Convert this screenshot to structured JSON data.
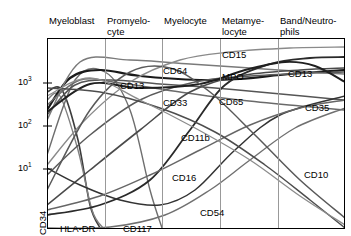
{
  "figure": {
    "kind": "antigen-expression-maturation-chart",
    "background": "#ffffff",
    "frame_color": "#000000",
    "divider_color": "#999999"
  },
  "stages": [
    {
      "id": "myeloblast",
      "label": "Myeloblast",
      "x": 47,
      "label_x": 49,
      "label_y": 16
    },
    {
      "id": "promyelocyte",
      "label": "Promyelo-\ncyte",
      "x": 105,
      "label_x": 107,
      "label_y": 16
    },
    {
      "id": "myelocyte",
      "label": "Myelocyte",
      "x": 162,
      "label_x": 164,
      "label_y": 16
    },
    {
      "id": "metamyelocyte",
      "label": "Metamye-\nlocyte",
      "x": 220,
      "label_x": 222,
      "label_y": 16
    },
    {
      "id": "band_neutrophil",
      "label": "Band/Neutro-\nphils",
      "x": 278,
      "label_x": 280,
      "label_y": 16
    }
  ],
  "yaxis": {
    "scale": "log",
    "ticks": [
      {
        "value": 1000,
        "mantissa": "10",
        "exponent": "3",
        "y": 83,
        "label_x": 18,
        "label_y": 77
      },
      {
        "value": 100,
        "mantissa": "10",
        "exponent": "2",
        "y": 126,
        "label_x": 18,
        "label_y": 120
      },
      {
        "value": 10,
        "mantissa": "10",
        "exponent": "1",
        "y": 169,
        "label_x": 18,
        "label_y": 163
      }
    ]
  },
  "markers": [
    {
      "name": "CD34",
      "x": 48,
      "y": 224,
      "rotated": true
    },
    {
      "name": "HLA-DR",
      "x": 60,
      "y": 223,
      "rotated": false
    },
    {
      "name": "CD117",
      "x": 123,
      "y": 223,
      "rotated": false
    },
    {
      "name": "CD13",
      "x": 120,
      "y": 80,
      "rotated": false
    },
    {
      "name": "CD64",
      "x": 163,
      "y": 65,
      "rotated": false
    },
    {
      "name": "CD33",
      "x": 163,
      "y": 97,
      "rotated": false
    },
    {
      "name": "CD11b",
      "x": 181,
      "y": 132,
      "rotated": false
    },
    {
      "name": "CD16",
      "x": 172,
      "y": 172,
      "rotated": false
    },
    {
      "name": "CD54",
      "x": 200,
      "y": 207,
      "rotated": false
    },
    {
      "name": "CD15",
      "x": 222,
      "y": 49,
      "rotated": false
    },
    {
      "name": "MPO",
      "x": 222,
      "y": 71,
      "rotated": false
    },
    {
      "name": "CD65",
      "x": 219,
      "y": 96,
      "rotated": false
    },
    {
      "name": "CD13",
      "x": 288,
      "y": 68,
      "rotated": false
    },
    {
      "name": "CD35",
      "x": 305,
      "y": 102,
      "rotated": false
    },
    {
      "name": "CD10",
      "x": 304,
      "y": 169,
      "rotated": false
    }
  ],
  "chart_data": {
    "type": "line",
    "title": "",
    "xlabel": "",
    "ylabel": "",
    "xscale": "maturation-stage",
    "yscale": "log",
    "ylim": [
      3,
      4000
    ],
    "grid": false,
    "legend": "inline-labels",
    "x": [
      "Myeloblast",
      "Promyelocyte",
      "Myelocyte",
      "Metamyelocyte",
      "Band/Neutrophils"
    ],
    "series": [
      {
        "name": "CD34",
        "color": "#3c3c3c",
        "width": 1.6,
        "values": [
          900,
          12,
          4,
          3,
          3
        ],
        "points": [
          [
            47,
            92
          ],
          [
            62,
            90
          ],
          [
            78,
            140
          ],
          [
            90,
            205
          ],
          [
            100,
            228
          ]
        ]
      },
      {
        "name": "HLA-DR",
        "color": "#808080",
        "width": 1.4,
        "values": [
          700,
          20,
          4,
          3,
          3
        ],
        "points": [
          [
            47,
            100
          ],
          [
            60,
            96
          ],
          [
            78,
            150
          ],
          [
            92,
            210
          ],
          [
            103,
            228
          ]
        ]
      },
      {
        "name": "CD117",
        "color": "#6e6e6e",
        "width": 1.4,
        "values": [
          60,
          600,
          250,
          12,
          4
        ],
        "points": [
          [
            47,
            155
          ],
          [
            75,
            80
          ],
          [
            105,
            72
          ],
          [
            130,
            110
          ],
          [
            150,
            190
          ],
          [
            162,
            228
          ]
        ]
      },
      {
        "name": "CD13",
        "color": "#1a1a1a",
        "width": 2.2,
        "values": [
          300,
          1000,
          900,
          800,
          1100
        ],
        "points": [
          [
            47,
            110
          ],
          [
            70,
            78
          ],
          [
            100,
            70
          ],
          [
            140,
            76
          ],
          [
            200,
            80
          ],
          [
            240,
            79
          ],
          [
            290,
            74
          ],
          [
            345,
            70
          ]
        ]
      },
      {
        "name": "CD64",
        "color": "#555555",
        "width": 1.5,
        "values": [
          250,
          800,
          700,
          600,
          450
        ],
        "points": [
          [
            47,
            115
          ],
          [
            75,
            85
          ],
          [
            110,
            80
          ],
          [
            160,
            84
          ],
          [
            215,
            88
          ],
          [
            270,
            93
          ],
          [
            345,
            100
          ]
        ]
      },
      {
        "name": "CD33",
        "color": "#6a6a6a",
        "width": 1.5,
        "values": [
          400,
          900,
          700,
          500,
          350
        ],
        "points": [
          [
            47,
            105
          ],
          [
            80,
            80
          ],
          [
            120,
            83
          ],
          [
            180,
            92
          ],
          [
            240,
            100
          ],
          [
            300,
            106
          ],
          [
            345,
            110
          ]
        ]
      },
      {
        "name": "MPO",
        "color": "#7a7a7a",
        "width": 1.5,
        "values": [
          200,
          1400,
          1200,
          1000,
          900
        ],
        "points": [
          [
            47,
            120
          ],
          [
            80,
            62
          ],
          [
            130,
            60
          ],
          [
            190,
            64
          ],
          [
            250,
            68
          ],
          [
            310,
            72
          ],
          [
            345,
            74
          ]
        ]
      },
      {
        "name": "CD15",
        "color": "#8a8a8a",
        "width": 1.4,
        "values": [
          20,
          200,
          900,
          1400,
          1500
        ],
        "points": [
          [
            47,
            165
          ],
          [
            85,
            120
          ],
          [
            130,
            82
          ],
          [
            180,
            60
          ],
          [
            230,
            52
          ],
          [
            290,
            48
          ],
          [
            345,
            47
          ]
        ]
      },
      {
        "name": "CD65",
        "color": "#5a5a5a",
        "width": 1.5,
        "values": [
          15,
          120,
          500,
          900,
          1000
        ],
        "points": [
          [
            47,
            175
          ],
          [
            90,
            135
          ],
          [
            140,
            100
          ],
          [
            195,
            82
          ],
          [
            250,
            76
          ],
          [
            310,
            73
          ],
          [
            345,
            72
          ]
        ]
      },
      {
        "name": "CD11b",
        "color": "#4a4a4a",
        "width": 1.6,
        "values": [
          5,
          20,
          150,
          700,
          1000
        ],
        "points": [
          [
            47,
            205
          ],
          [
            90,
            170
          ],
          [
            140,
            130
          ],
          [
            190,
            92
          ],
          [
            240,
            76
          ],
          [
            300,
            70
          ],
          [
            345,
            68
          ]
        ]
      },
      {
        "name": "CD16",
        "color": "#2a2a2a",
        "width": 1.8,
        "values": [
          4,
          6,
          25,
          400,
          1200
        ],
        "points": [
          [
            47,
            215
          ],
          [
            100,
            205
          ],
          [
            150,
            180
          ],
          [
            190,
            130
          ],
          [
            225,
            85
          ],
          [
            270,
            64
          ],
          [
            310,
            58
          ],
          [
            345,
            57
          ]
        ]
      },
      {
        "name": "CD54",
        "color": "#333333",
        "width": 1.5,
        "values": [
          30,
          12,
          8,
          40,
          300
        ],
        "points": [
          [
            47,
            168
          ],
          [
            80,
            185
          ],
          [
            120,
            200
          ],
          [
            160,
            205
          ],
          [
            195,
            190
          ],
          [
            235,
            150
          ],
          [
            280,
            115
          ],
          [
            345,
            96
          ]
        ]
      },
      {
        "name": "CD10",
        "color": "#707070",
        "width": 1.4,
        "values": [
          3,
          3,
          4,
          15,
          400
        ],
        "points": [
          [
            47,
            228
          ],
          [
            110,
            227
          ],
          [
            165,
            215
          ],
          [
            210,
            190
          ],
          [
            250,
            160
          ],
          [
            295,
            128
          ],
          [
            345,
            108
          ]
        ]
      },
      {
        "name": "CD35",
        "color": "#666666",
        "width": 1.4,
        "values": [
          5,
          8,
          20,
          90,
          300
        ],
        "points": [
          [
            47,
            210
          ],
          [
            100,
            196
          ],
          [
            150,
            175
          ],
          [
            200,
            150
          ],
          [
            250,
            125
          ],
          [
            300,
            108
          ],
          [
            345,
            100
          ]
        ]
      },
      {
        "name": "CD13-late",
        "color": "#202020",
        "width": 1.9,
        "values": [
          250,
          700,
          600,
          900,
          500
        ],
        "points": [
          [
            47,
            112
          ],
          [
            90,
            84
          ],
          [
            140,
            88
          ],
          [
            200,
            84
          ],
          [
            245,
            70
          ],
          [
            285,
            62
          ],
          [
            315,
            66
          ],
          [
            345,
            82
          ]
        ]
      },
      {
        "name": "decline-curve-a",
        "color": "#4d4d4d",
        "width": 1.5,
        "values": [
          800,
          700,
          400,
          120,
          20
        ],
        "points": [
          [
            47,
            88
          ],
          [
            100,
            92
          ],
          [
            160,
            108
          ],
          [
            215,
            132
          ],
          [
            265,
            165
          ],
          [
            310,
            200
          ],
          [
            345,
            228
          ]
        ]
      },
      {
        "name": "decline-curve-b",
        "color": "#8c8c8c",
        "width": 1.3,
        "values": [
          600,
          900,
          500,
          150,
          30
        ],
        "points": [
          [
            47,
            96
          ],
          [
            90,
            78
          ],
          [
            140,
            100
          ],
          [
            195,
            128
          ],
          [
            250,
            160
          ],
          [
            300,
            196
          ],
          [
            345,
            225
          ]
        ]
      },
      {
        "name": "rise-fall-curve",
        "color": "#595959",
        "width": 1.5,
        "values": [
          10,
          300,
          1000,
          300,
          40
        ],
        "points": [
          [
            47,
            190
          ],
          [
            90,
            110
          ],
          [
            130,
            72
          ],
          [
            170,
            68
          ],
          [
            210,
            92
          ],
          [
            255,
            135
          ],
          [
            300,
            180
          ],
          [
            345,
            218
          ]
        ]
      }
    ],
    "annotations": [
      {
        "text": "CD34",
        "stage": "Myeloblast",
        "orientation": "vertical"
      },
      {
        "text": "HLA-DR",
        "stage": "Myeloblast",
        "orientation": "horizontal"
      },
      {
        "text": "CD117",
        "stage": "Promyelocyte",
        "orientation": "horizontal"
      },
      {
        "text": "CD13",
        "stage": "Promyelocyte",
        "orientation": "horizontal"
      },
      {
        "text": "CD64",
        "stage": "Myelocyte",
        "orientation": "horizontal"
      },
      {
        "text": "CD33",
        "stage": "Myelocyte",
        "orientation": "horizontal"
      },
      {
        "text": "CD11b",
        "stage": "Myelocyte",
        "orientation": "horizontal"
      },
      {
        "text": "CD16",
        "stage": "Myelocyte",
        "orientation": "horizontal"
      },
      {
        "text": "CD54",
        "stage": "Metamyelocyte",
        "orientation": "horizontal"
      },
      {
        "text": "CD15",
        "stage": "Metamyelocyte",
        "orientation": "horizontal"
      },
      {
        "text": "MPO",
        "stage": "Metamyelocyte",
        "orientation": "horizontal"
      },
      {
        "text": "CD65",
        "stage": "Metamyelocyte",
        "orientation": "horizontal"
      },
      {
        "text": "CD13",
        "stage": "Band/Neutrophils",
        "orientation": "horizontal"
      },
      {
        "text": "CD35",
        "stage": "Band/Neutrophils",
        "orientation": "horizontal"
      },
      {
        "text": "CD10",
        "stage": "Band/Neutrophils",
        "orientation": "horizontal"
      }
    ]
  }
}
